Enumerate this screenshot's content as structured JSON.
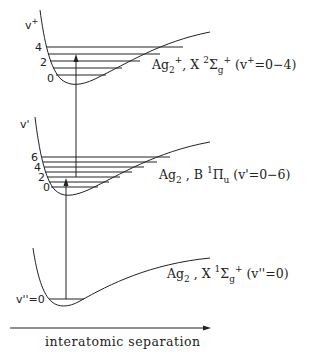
{
  "diagram": {
    "type": "potential-energy-curves",
    "axis": {
      "x_label": "interatomic separation"
    },
    "states": [
      {
        "id": "cation",
        "molecule": "Ag",
        "molecule_sub": "2",
        "molecule_sup": "+",
        "separator": ",",
        "term_letter": "X",
        "multiplicity": "2",
        "term_symbol": "Σ",
        "term_sub": "g",
        "term_sup": "+",
        "range_prefix": "(v",
        "range_sup": "+",
        "range_suffix": "=0−4)",
        "axis_label": "v",
        "axis_label_sup": "+",
        "level_labels": [
          "4",
          "2",
          "0"
        ]
      },
      {
        "id": "excited",
        "molecule": "Ag",
        "molecule_sub": "2",
        "separator": ",",
        "term_letter": "B",
        "multiplicity": "1",
        "term_symbol": "Π",
        "term_sub": "u",
        "range_text": "(v'=0−6)",
        "axis_label": "v'",
        "level_labels": [
          "6",
          "4",
          "2",
          "0"
        ]
      },
      {
        "id": "ground",
        "molecule": "Ag",
        "molecule_sub": "2",
        "separator": ",",
        "term_letter": "X",
        "multiplicity": "1",
        "term_symbol": "Σ",
        "term_sub": "g",
        "term_sup": "+",
        "range_text": "(v''=0)",
        "level_label": "v''=0"
      }
    ]
  }
}
